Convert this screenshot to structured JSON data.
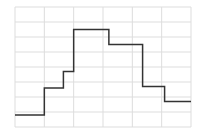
{
  "chart_data": {
    "type": "line",
    "style": "step",
    "title": "",
    "xlabel": "",
    "ylabel": "",
    "xlim": [
      0,
      6
    ],
    "ylim": [
      0,
      8
    ],
    "grid": true,
    "legend": null,
    "x": [
      0,
      1,
      1.65,
      2,
      3.2,
      4.35,
      5.1,
      6
    ],
    "y": [
      0.8,
      2.6,
      3.7,
      6.5,
      5.5,
      2.7,
      1.7,
      1.7
    ],
    "colors": {
      "line": "#333333",
      "grid": "#dddddd",
      "background": "#ffffff"
    }
  },
  "plot_area": {
    "left": 15,
    "top": 7,
    "right": 191,
    "bottom": 127
  }
}
